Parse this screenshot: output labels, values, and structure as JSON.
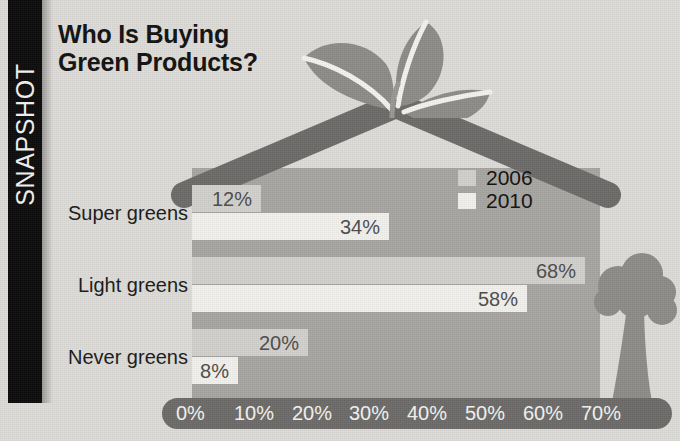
{
  "rail": {
    "label": "SNAPSHOT"
  },
  "headline": {
    "text": "Who Is Buying\nGreen Products?"
  },
  "legend": {
    "items": [
      {
        "label": "2006",
        "color": "#d3d1cd"
      },
      {
        "label": "2010",
        "color": "#f2f1ee"
      }
    ]
  },
  "graphics": {
    "house": "house-shape",
    "roof": "roof-icon",
    "sprout": "sprout-plant-icon",
    "tree": "tree-icon"
  },
  "chart_data": {
    "type": "bar",
    "orientation": "horizontal",
    "title": "Who Is Buying Green Products?",
    "xlabel": "",
    "ylabel": "",
    "categories": [
      "Super greens",
      "Light greens",
      "Never greens"
    ],
    "series": [
      {
        "name": "2006",
        "color": "#d3d1cd",
        "values": [
          12,
          68,
          20
        ],
        "labels": [
          "12%",
          "68%",
          "20%"
        ]
      },
      {
        "name": "2010",
        "color": "#f2f1ee",
        "values": [
          34,
          58,
          8
        ],
        "labels": [
          "34%",
          "58%",
          "8%"
        ]
      }
    ],
    "xlim": [
      0,
      70
    ],
    "xticks": [
      0,
      10,
      20,
      30,
      40,
      50,
      60,
      70
    ],
    "xtick_labels": [
      "0%",
      "10%",
      "20%",
      "30%",
      "40%",
      "50%",
      "60%",
      "70%"
    ],
    "grid": false,
    "legend_position": "inside-top-right"
  }
}
